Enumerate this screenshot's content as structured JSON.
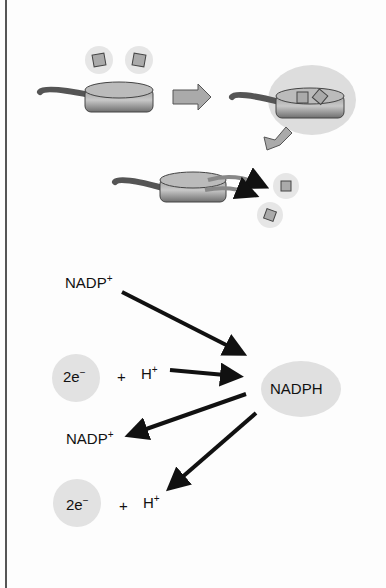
{
  "diagram": {
    "top_panel": {
      "description": "Pan analogy: pan picks up hot items, carries them, and drops them off",
      "stages": [
        "empty-pan-with-two-items",
        "pan-carrying-items",
        "pan-releasing-items"
      ]
    },
    "reaction": {
      "reactant_top": {
        "base": "NADP",
        "sup": "+"
      },
      "electrons_in": {
        "base": "2e",
        "sup": "−"
      },
      "plus_in": "+",
      "proton_in": {
        "base": "H",
        "sup": "+"
      },
      "product": "NADPH",
      "released_nadp": {
        "base": "NADP",
        "sup": "+"
      },
      "electrons_out": {
        "base": "2e",
        "sup": "−"
      },
      "plus_out": "+",
      "proton_out": {
        "base": "H",
        "sup": "+"
      }
    }
  }
}
